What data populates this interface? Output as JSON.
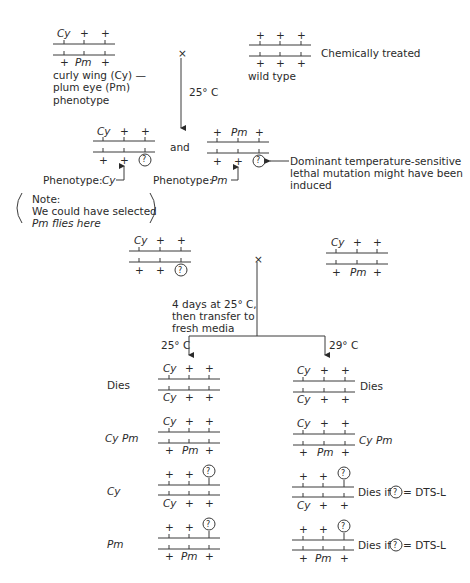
{
  "parents": {
    "left": {
      "top": [
        "Cy",
        "+",
        "+"
      ],
      "bottom": [
        "+",
        "Pm",
        "+"
      ],
      "caption": [
        "curly wing (Cy) —",
        "plum eye (Pm)",
        "phenotype"
      ]
    },
    "right": {
      "top": [
        "+",
        "+",
        "+"
      ],
      "bottom": [
        "+",
        "+",
        "+"
      ],
      "caption": "wild type",
      "side_label": "Chemically treated"
    },
    "cross_symbol": "×",
    "temperature": "25° C"
  },
  "f1": {
    "left": {
      "top": [
        "Cy",
        "+",
        "+"
      ],
      "bottom": [
        "+",
        "+",
        "?"
      ],
      "phenotype_label": "Phenotype: ",
      "phenotype_value": "Cy"
    },
    "connector": "and",
    "right": {
      "top": [
        "+",
        "Pm",
        "+"
      ],
      "bottom": [
        "+",
        "+",
        "?"
      ],
      "phenotype_label": "Phenotype: ",
      "phenotype_value": "Pm"
    },
    "annotation": [
      "Dominant temperature-sensitive",
      "lethal mutation might have been",
      "induced"
    ],
    "note": [
      "Note:",
      "We could have selected",
      "Pm flies here"
    ]
  },
  "second_cross": {
    "left": {
      "top": [
        "Cy",
        "+",
        "+"
      ],
      "bottom": [
        "+",
        "+",
        "?"
      ]
    },
    "right": {
      "top": [
        "Cy",
        "+",
        "+"
      ],
      "bottom": [
        "+",
        "Pm",
        "+"
      ]
    },
    "cross_symbol": "×",
    "instructions": [
      "4 days at 25° C,",
      "then transfer to",
      "fresh media"
    ],
    "branch_left_temp": "25° C",
    "branch_right_temp": "29° C"
  },
  "progeny": [
    {
      "top": [
        "Cy",
        "+",
        "+"
      ],
      "bottom": [
        "Cy",
        "+",
        "+"
      ],
      "left_label": "Dies",
      "right_label": "Dies"
    },
    {
      "top": [
        "Cy",
        "+",
        "+"
      ],
      "bottom": [
        "+",
        "Pm",
        "+"
      ],
      "left_label": "Cy Pm",
      "right_label": "Cy Pm"
    },
    {
      "top": [
        "+",
        "+",
        "?"
      ],
      "bottom": [
        "Cy",
        "+",
        "+"
      ],
      "left_label": "Cy",
      "right_label_pre": "Dies if",
      "right_label_post": "= DTS-L"
    },
    {
      "top": [
        "+",
        "+",
        "?"
      ],
      "bottom": [
        "+",
        "Pm",
        "+"
      ],
      "left_label": "Pm",
      "right_label_pre": "Dies if",
      "right_label_post": "= DTS-L"
    }
  ]
}
